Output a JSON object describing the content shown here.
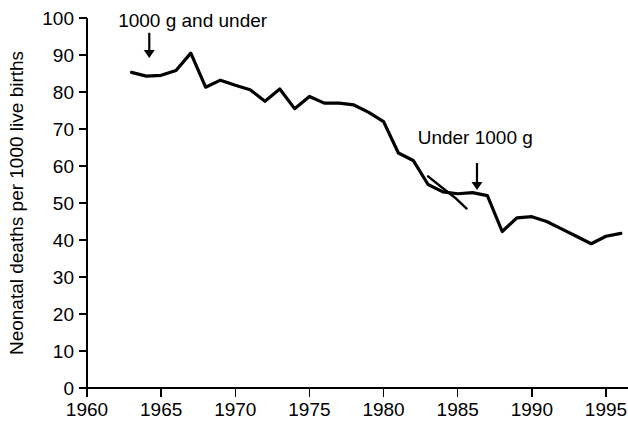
{
  "chart_data": {
    "type": "line",
    "title": "",
    "subtitle": "",
    "xlabel": "",
    "ylabel": "Neonatal deaths per 1000 live births",
    "xlim": [
      1960,
      1996
    ],
    "ylim": [
      0,
      100
    ],
    "grid": false,
    "legend_position": "none",
    "x_ticks": [
      1960,
      1965,
      1970,
      1975,
      1980,
      1985,
      1990,
      1995
    ],
    "x_tick_labels": [
      "1960",
      "1965",
      "1970",
      "1975",
      "1980",
      "1985",
      "1990",
      "1995"
    ],
    "y_ticks": [
      0,
      10,
      20,
      30,
      40,
      50,
      60,
      70,
      80,
      90,
      100
    ],
    "y_tick_labels": [
      "0",
      "10",
      "20",
      "30",
      "40",
      "50",
      "60",
      "70",
      "80",
      "90",
      "100"
    ],
    "series": [
      {
        "name": "1000 g and under",
        "x": [
          1963,
          1964,
          1965,
          1966,
          1967,
          1968,
          1969,
          1970,
          1971,
          1972,
          1973,
          1974,
          1975,
          1976,
          1977,
          1978,
          1979,
          1980,
          1981,
          1982,
          1983,
          1984,
          1985,
          1986,
          1987,
          1988,
          1989,
          1990,
          1991,
          1992,
          1993,
          1994,
          1995,
          1996
        ],
        "values": [
          85.3,
          84.3,
          84.5,
          85.8,
          90.5,
          81.3,
          83.2,
          81.8,
          80.6,
          77.5,
          80.8,
          75.5,
          78.8,
          77.0,
          77.0,
          76.5,
          74.5,
          72.0,
          63.5,
          61.5,
          55.0,
          53.0,
          52.5,
          52.8,
          52.0,
          42.3,
          46.0,
          46.3,
          45.0,
          43.0,
          41.0,
          39.0,
          41.0,
          41.8
        ]
      },
      {
        "name": "Under 1000 g",
        "x": [
          1983.0,
          1984.0,
          1984.8,
          1985.6
        ],
        "values": [
          57.2,
          54.0,
          51.5,
          48.5
        ]
      }
    ],
    "annotations": [
      {
        "id": "annotation-1000g-and-under",
        "label": "1000 g and under",
        "text_x": 1962.1,
        "text_y": 97.5,
        "arrow_x": 1964.2,
        "arrow_y_top": 96.0,
        "arrow_y_bottom": 89.2
      },
      {
        "id": "annotation-under-1000g",
        "label": "Under 1000 g",
        "text_x": 1982.3,
        "text_y": 66.0,
        "arrow_x": 1986.3,
        "arrow_y_top": 60.8,
        "arrow_y_bottom": 53.5
      }
    ],
    "colors": {
      "line": "#000000",
      "axis": "#000000",
      "background": "#ffffff",
      "text": "#000000"
    }
  }
}
